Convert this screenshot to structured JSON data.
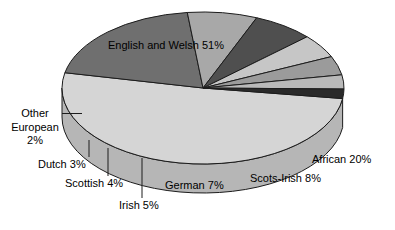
{
  "chart_data": {
    "type": "pie",
    "title": "",
    "subtitle": "",
    "xlabel": "",
    "ylabel": "",
    "legend_position": "none",
    "grid": false,
    "three_d": true,
    "categories": [
      "English and Welsh",
      "African",
      "Scots-Irish",
      "German",
      "Irish",
      "Scottish",
      "Dutch",
      "Other European"
    ],
    "values": [
      51,
      20,
      8,
      7,
      5,
      4,
      3,
      2
    ],
    "units": "%",
    "slices": [
      {
        "name": "English and Welsh",
        "value": 51,
        "label": "English and Welsh 51%",
        "color": "#d5d5d5",
        "side_color": "#b6b6b6"
      },
      {
        "name": "African",
        "value": 20,
        "label": "African 20%",
        "color": "#6f6f6f",
        "side_color": "#545454"
      },
      {
        "name": "Scots-Irish",
        "value": 8,
        "label": "Scots-Irish 8%",
        "color": "#a8a8a8",
        "side_color": "#8a8a8a"
      },
      {
        "name": "German",
        "value": 7,
        "label": "German 7%",
        "color": "#4f4f4f",
        "side_color": "#3b3b3b"
      },
      {
        "name": "Irish",
        "value": 5,
        "label": "Irish 5%",
        "color": "#c6c6c6",
        "side_color": "#a5a5a5"
      },
      {
        "name": "Scottish",
        "value": 4,
        "label": "Scottish 4%",
        "color": "#9b9b9b",
        "side_color": "#7e7e7e"
      },
      {
        "name": "Dutch",
        "value": 3,
        "label": "Dutch 3%",
        "color": "#b9b9b9",
        "side_color": "#989898"
      },
      {
        "name": "Other European",
        "value": 2,
        "label": "Other European 2%",
        "color": "#2a2a2a",
        "side_color": "#1a1a1a"
      }
    ]
  },
  "labels": {
    "english_and_welsh": "English and Welsh 51%",
    "african": "African 20%",
    "scots_irish": "Scots-Irish 8%",
    "german": "German 7%",
    "irish": "Irish 5%",
    "scottish": "Scottish 4%",
    "dutch": "Dutch 3%",
    "other_european_line1": "Other",
    "other_european_line2": "European",
    "other_european_line3": "2%"
  },
  "style": {
    "background": "#ffffff",
    "text_color": "#000000",
    "outline_color": "#1c1c1c"
  }
}
